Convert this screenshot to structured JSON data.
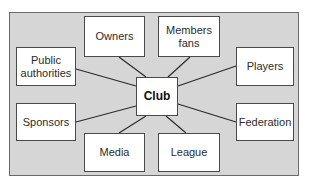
{
  "diagram": {
    "type": "stakeholder-hub",
    "center": {
      "id": "club",
      "label": "Club",
      "box": [
        136,
        77,
        42,
        39
      ]
    },
    "nodes": [
      {
        "id": "owners",
        "label": "Owners",
        "box": [
          84,
          16,
          61,
          41
        ]
      },
      {
        "id": "members-fans",
        "label": "Members\nfans",
        "box": [
          158,
          16,
          62,
          41
        ]
      },
      {
        "id": "public-authorities",
        "label": "Public\nauthorities",
        "box": [
          16,
          47,
          60,
          39
        ]
      },
      {
        "id": "players",
        "label": "Players",
        "box": [
          236,
          47,
          58,
          39
        ]
      },
      {
        "id": "sponsors",
        "label": "Sponsors",
        "box": [
          16,
          103,
          60,
          38
        ]
      },
      {
        "id": "federation",
        "label": "Federation",
        "box": [
          236,
          103,
          58,
          38
        ]
      },
      {
        "id": "media",
        "label": "Media",
        "box": [
          84,
          133,
          61,
          39
        ]
      },
      {
        "id": "league",
        "label": "League",
        "box": [
          158,
          133,
          62,
          39
        ]
      }
    ],
    "edges": [
      {
        "from": "club",
        "to": "owners",
        "line": [
          146,
          77,
          119,
          57
        ]
      },
      {
        "from": "club",
        "to": "members-fans",
        "line": [
          168,
          77,
          190,
          57
        ]
      },
      {
        "from": "club",
        "to": "public-authorities",
        "line": [
          136,
          86,
          76,
          69
        ]
      },
      {
        "from": "club",
        "to": "players",
        "line": [
          178,
          86,
          236,
          66
        ]
      },
      {
        "from": "club",
        "to": "sponsors",
        "line": [
          136,
          106,
          76,
          122
        ]
      },
      {
        "from": "club",
        "to": "federation",
        "line": [
          178,
          104,
          236,
          122
        ]
      },
      {
        "from": "club",
        "to": "media",
        "line": [
          146,
          116,
          119,
          133
        ]
      },
      {
        "from": "club",
        "to": "league",
        "line": [
          166,
          116,
          186,
          133
        ]
      }
    ],
    "colors": {
      "background": "#d6d6d6",
      "box_fill": "#ffffff",
      "line": "#2a2a2a"
    }
  }
}
